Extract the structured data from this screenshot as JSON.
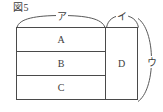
{
  "figure": {
    "label": "図5",
    "caption_number": "5"
  },
  "diagram": {
    "type": "block-partition",
    "left_column": {
      "cells": [
        {
          "label": "A"
        },
        {
          "label": "B"
        },
        {
          "label": "C"
        }
      ]
    },
    "right_column": {
      "cells": [
        {
          "label": "D"
        }
      ]
    },
    "braces": [
      {
        "name": "brace-top-left",
        "label": "ア",
        "orientation": "horizontal",
        "spans": "A-B-C column width"
      },
      {
        "name": "brace-top-right",
        "label": "イ",
        "orientation": "horizontal",
        "spans": "D column width"
      },
      {
        "name": "brace-right",
        "label": "ウ",
        "orientation": "vertical",
        "spans": "full height"
      }
    ]
  },
  "colors": {
    "line": "#4a4a4a",
    "brace": "#585858",
    "text": "#3d3d3d",
    "background": "#ffffff"
  }
}
